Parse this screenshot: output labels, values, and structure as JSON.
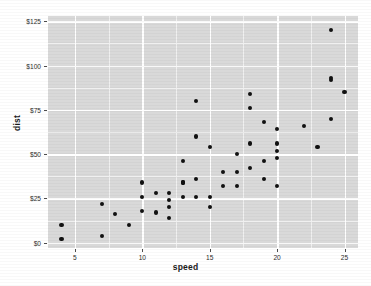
{
  "chart_data": {
    "type": "scatter",
    "title": "",
    "subtitle": "",
    "xlabel": "speed",
    "ylabel": "dist",
    "xlim": [
      3,
      26
    ],
    "ylim": [
      -3,
      128
    ],
    "grid": true,
    "legend": false,
    "legend_position": "none",
    "point_color": "#111111",
    "panel_color": "#d9d9d9",
    "gridline_color": "#ffffff",
    "x_ticks": [
      {
        "value": 5,
        "label": "5"
      },
      {
        "value": 10,
        "label": "10"
      },
      {
        "value": 15,
        "label": "15"
      },
      {
        "value": 20,
        "label": "20"
      },
      {
        "value": 25,
        "label": "25"
      }
    ],
    "y_ticks": [
      {
        "value": 0,
        "label": "$0"
      },
      {
        "value": 25,
        "label": "$25"
      },
      {
        "value": 50,
        "label": "$50"
      },
      {
        "value": 75,
        "label": "$75"
      },
      {
        "value": 100,
        "label": "$100"
      },
      {
        "value": 125,
        "label": "$125"
      }
    ],
    "x_minor_ticks": [
      7.5,
      12.5,
      17.5,
      22.5
    ],
    "y_minor_ticks": [
      12.5,
      37.5,
      62.5,
      87.5,
      112.5
    ],
    "x": [
      4,
      4,
      7,
      7,
      8,
      9,
      10,
      10,
      10,
      11,
      11,
      12,
      12,
      12,
      12,
      13,
      13,
      13,
      13,
      14,
      14,
      14,
      14,
      15,
      15,
      15,
      16,
      16,
      17,
      17,
      17,
      18,
      18,
      18,
      18,
      19,
      19,
      19,
      20,
      20,
      20,
      20,
      20,
      22,
      23,
      24,
      24,
      24,
      24,
      25
    ],
    "y": [
      2,
      10,
      4,
      22,
      16,
      10,
      18,
      26,
      34,
      17,
      28,
      14,
      20,
      24,
      28,
      26,
      34,
      34,
      46,
      26,
      36,
      60,
      80,
      20,
      26,
      54,
      32,
      40,
      32,
      40,
      50,
      42,
      56,
      76,
      84,
      36,
      46,
      68,
      32,
      48,
      52,
      56,
      64,
      66,
      54,
      70,
      92,
      93,
      120,
      85
    ]
  }
}
